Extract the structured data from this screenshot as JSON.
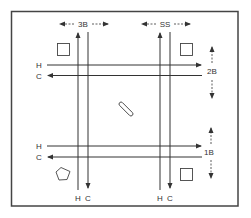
{
  "diagram": {
    "type": "room-layout",
    "colors": {
      "line": "#333333",
      "frame": "#444444",
      "background": "#ffffff"
    },
    "top_labels": [
      {
        "id": "3B",
        "text": "3B"
      },
      {
        "id": "SS",
        "text": "SS"
      }
    ],
    "side_labels": [
      {
        "id": "2B",
        "text": "2B"
      },
      {
        "id": "1B",
        "text": "1B"
      }
    ],
    "horizontal_pipes": {
      "top": {
        "h": "H",
        "c": "C"
      },
      "bottom": {
        "h": "H",
        "c": "C"
      }
    },
    "vertical_pipes": {
      "left": {
        "h": "H",
        "c": "C"
      },
      "right": {
        "h": "H",
        "c": "C"
      }
    },
    "objects": [
      {
        "shape": "square",
        "position": "top-left"
      },
      {
        "shape": "square",
        "position": "top-right"
      },
      {
        "shape": "square",
        "position": "bottom-right"
      },
      {
        "shape": "pentagon",
        "position": "bottom-left"
      },
      {
        "shape": "diagonal-bar",
        "position": "center"
      }
    ]
  }
}
